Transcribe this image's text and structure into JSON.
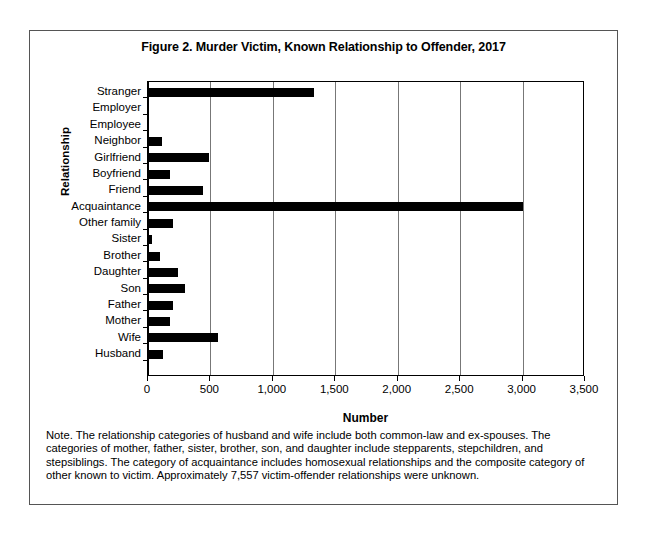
{
  "figure": {
    "title": "Figure 2. Murder Victim, Known Relationship to Offender, 2017",
    "note": "Note.  The relationship categories of husband and wife include both common-law and ex-spouses. The categories of mother, father, sister, brother, son, and daughter include stepparents, stepchildren, and stepsiblings. The category of acquaintance includes homosexual relationships and the composite category of other known to victim. Approximately 7,557 victim-offender relationships were unknown."
  },
  "chart_data": {
    "type": "bar",
    "orientation": "horizontal",
    "title": "Figure 2. Murder Victim, Known Relationship to Offender, 2017",
    "xlabel": "Number",
    "ylabel": "Relationship",
    "xlim": [
      0,
      3500
    ],
    "xticks": [
      0,
      500,
      1000,
      1500,
      2000,
      2500,
      3000,
      3500
    ],
    "xtick_labels": [
      "0",
      "500",
      "1,000",
      "1,500",
      "2,000",
      "2,500",
      "3,000",
      "3,500"
    ],
    "grid": "vertical",
    "legend": "none",
    "bar_color": "#000000",
    "categories": [
      "Stranger",
      "Employer",
      "Employee",
      "Neighbor",
      "Girlfriend",
      "Boyfriend",
      "Friend",
      "Acquaintance",
      "Other family",
      "Sister",
      "Brother",
      "Daughter",
      "Son",
      "Father",
      "Mother",
      "Wife",
      "Husband"
    ],
    "values": [
      1330,
      12,
      10,
      110,
      490,
      180,
      440,
      3000,
      200,
      30,
      100,
      240,
      300,
      200,
      175,
      560,
      120
    ]
  }
}
